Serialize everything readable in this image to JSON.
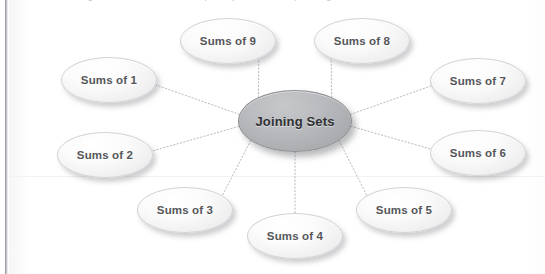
{
  "page": {
    "cropped_header_text": "The diagram below shows a hub-and-spoke layout used in the preceding exercise.",
    "background_color": "#ffffff",
    "binding_edge_color": "#8a8d92"
  },
  "diagram": {
    "type": "hub-and-spoke",
    "title": "Joining Sets",
    "center_node": {
      "label": "Joining Sets",
      "fill_color": "#b0b1b4",
      "text_color": "#2f3033",
      "cx": 295,
      "cy": 121,
      "rx": 57,
      "ry": 31
    },
    "connector_style": {
      "kind": "dotted",
      "color": "#b8babd",
      "width": 1
    },
    "leaf_fill_color": "#f2f2f3",
    "leaf_text_color": "#55565a",
    "nodes": [
      {
        "label": "Sums of 1",
        "cx": 109,
        "cy": 80,
        "rx": 48,
        "ry": 23
      },
      {
        "label": "Sums of 2",
        "cx": 105,
        "cy": 155,
        "rx": 48,
        "ry": 23
      },
      {
        "label": "Sums of 3",
        "cx": 185,
        "cy": 210,
        "rx": 48,
        "ry": 23
      },
      {
        "label": "Sums of 4",
        "cx": 295,
        "cy": 236,
        "rx": 48,
        "ry": 23
      },
      {
        "label": "Sums of 5",
        "cx": 404,
        "cy": 210,
        "rx": 48,
        "ry": 23
      },
      {
        "label": "Sums of 6",
        "cx": 478,
        "cy": 153,
        "rx": 48,
        "ry": 23
      },
      {
        "label": "Sums of 7",
        "cx": 478,
        "cy": 81,
        "rx": 48,
        "ry": 23
      },
      {
        "label": "Sums of 8",
        "cx": 362,
        "cy": 41,
        "rx": 48,
        "ry": 23
      },
      {
        "label": "Sums of 9",
        "cx": 228,
        "cy": 41,
        "rx": 48,
        "ry": 23
      }
    ]
  }
}
